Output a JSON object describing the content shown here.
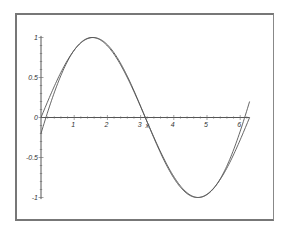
{
  "chart_data": {
    "type": "line",
    "title": "",
    "xlabel": "x",
    "ylabel": "",
    "xlim": [
      0,
      6.2832
    ],
    "ylim": [
      -1,
      1
    ],
    "x_ticks": [
      "1",
      "2",
      "3",
      "4",
      "5",
      "6"
    ],
    "y_ticks": [
      "1",
      "0.5",
      "0",
      "-0.5",
      "-1"
    ],
    "grid": false,
    "legend": null,
    "series": [
      {
        "name": "sin(x)",
        "function": "sin",
        "x": [
          0,
          0.785,
          1.571,
          2.356,
          3.142,
          3.927,
          4.712,
          5.498,
          6.283
        ],
        "values": [
          0,
          0.707,
          1,
          0.707,
          0,
          -0.707,
          -1,
          -0.707,
          0
        ]
      },
      {
        "name": "polynomial approximation",
        "function": "poly",
        "coefficients_about_pi": {
          "u1": -0.9624,
          "u3": 0.14158,
          "u5": -0.003811
        },
        "x": [
          0,
          0.785,
          1.571,
          2.356,
          3.142,
          3.927,
          4.712,
          5.498,
          6.283
        ],
        "values": [
          -0.2,
          0.68,
          1.0,
          0.69,
          0,
          -0.69,
          -1.0,
          -0.68,
          0.2
        ]
      }
    ]
  },
  "axes": {
    "x_label": "x",
    "x_tick_labels": [
      "1",
      "2",
      "3",
      "4",
      "5",
      "6"
    ],
    "y_tick_labels": [
      "1",
      "0.5",
      "0",
      "-0.5",
      "-1"
    ]
  }
}
